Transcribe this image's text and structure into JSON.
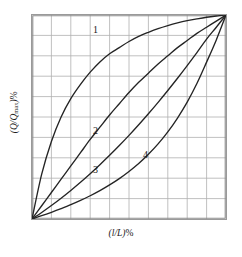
{
  "figure": {
    "kind": "valve-flow-characteristic-curves",
    "background_color": "#ffffff"
  },
  "axes": {
    "x_title_open": "(",
    "x_title_var": "l/L",
    "x_title_close": ")",
    "x_title_unit": "%",
    "y_title_open": "(",
    "y_title_var": "Q/Q",
    "y_title_sub": "max",
    "y_title_close": ")",
    "y_title_unit": "%",
    "grid_color": "#b0b0b0",
    "frame_color": "#8c8c8c"
  },
  "labels": {
    "curve_1": "1",
    "curve_2": "2",
    "curve_3": "3",
    "curve_4": "4"
  },
  "chart_data": {
    "type": "line",
    "title": "",
    "subtitle": "",
    "xlabel": "(l/L)%",
    "ylabel": "(Q/Qmax)%",
    "xlim": [
      0,
      100
    ],
    "ylim": [
      0,
      100
    ],
    "grid": true,
    "grid_divisions_x": 10,
    "grid_divisions_y": 10,
    "xticks": [
      0,
      10,
      20,
      30,
      40,
      50,
      60,
      70,
      80,
      90,
      100
    ],
    "yticks": [
      0,
      10,
      20,
      30,
      40,
      50,
      60,
      70,
      80,
      90,
      100
    ],
    "xtick_labels": [],
    "ytick_labels": [],
    "legend": "inline-numeric-annotations",
    "legend_position": "on-curve",
    "line_color": "#242424",
    "x": [
      0,
      5,
      10,
      15,
      20,
      25,
      30,
      35,
      40,
      45,
      50,
      55,
      60,
      65,
      70,
      75,
      80,
      85,
      90,
      95,
      100
    ],
    "series": [
      {
        "name": "1",
        "annotation": "1",
        "annotation_x": 32,
        "annotation_y": 95,
        "description": "quick-opening characteristic, concave downward",
        "values": [
          0,
          22,
          38,
          50,
          59,
          66,
          72,
          77,
          81,
          84,
          87,
          89.5,
          91.5,
          93.3,
          94.8,
          96.1,
          97.2,
          98.1,
          98.9,
          99.5,
          100
        ]
      },
      {
        "name": "2",
        "annotation": "2",
        "annotation_x": 32,
        "annotation_y": 45,
        "description": "linear characteristic, slightly bowed above the diagonal",
        "values": [
          0,
          6.5,
          13,
          19.5,
          26,
          32.5,
          39,
          45,
          51,
          56.5,
          62,
          67,
          71.5,
          76,
          80,
          84,
          87.5,
          91,
          94,
          97,
          100
        ]
      },
      {
        "name": "3",
        "annotation": "3",
        "annotation_x": 32,
        "annotation_y": 26,
        "description": "modified parabolic characteristic, between linear and equal-percentage",
        "values": [
          0,
          3.2,
          6.6,
          10.2,
          14,
          18,
          22.2,
          26.6,
          31.2,
          36,
          41,
          46.2,
          51.6,
          57.2,
          63,
          69,
          75.2,
          81.6,
          88.2,
          94,
          100
        ]
      },
      {
        "name": "4",
        "annotation": "4",
        "annotation_x": 58,
        "annotation_y": 34,
        "description": "equal-percentage characteristic, concave upward",
        "values": [
          0,
          1.6,
          3.3,
          5.1,
          7.0,
          9.1,
          11.4,
          13.9,
          16.7,
          19.8,
          23.3,
          27.2,
          31.7,
          36.8,
          42.7,
          49.5,
          57.3,
          66.4,
          76.9,
          87.8,
          100
        ]
      }
    ]
  }
}
